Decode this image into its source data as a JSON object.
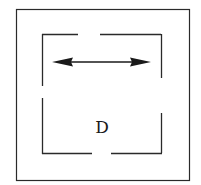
{
  "diagram": {
    "label": "D",
    "colors": {
      "stroke": "#2a2a2a",
      "background": "#ffffff"
    },
    "outer_box": {
      "x": 16,
      "y": 9,
      "width": 173,
      "height": 171
    },
    "inner_box": {
      "x": 42,
      "y": 34,
      "width": 119,
      "height": 119,
      "gaps": {
        "top": [
          78,
          100
        ],
        "bottom": [
          92,
          111
        ],
        "left": [
          86,
          98
        ],
        "right": [
          78,
          113
        ]
      }
    },
    "arrow": {
      "x1": 52,
      "x2": 151,
      "y": 62,
      "type": "double-headed"
    }
  }
}
